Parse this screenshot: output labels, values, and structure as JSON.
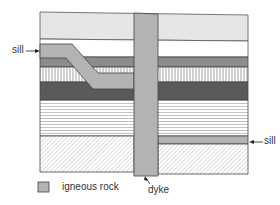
{
  "diagram": {
    "labels": {
      "sill_left": "sill",
      "sill_right": "sill",
      "dyke": "dyke"
    },
    "legend": {
      "items": [
        {
          "swatch_color": "#b3b3b3",
          "label": "igneous rock"
        }
      ]
    },
    "layers": [
      {
        "name": "top-pale-layer",
        "fill": "#e6e6e6"
      },
      {
        "name": "white-layer",
        "fill": "#ffffff"
      },
      {
        "name": "grey-layer",
        "fill": "#8c8c8c"
      },
      {
        "name": "vertical-hatch-layer",
        "fill": "#ffffff",
        "pattern": "vertical-lines"
      },
      {
        "name": "dark-layer",
        "fill": "#5a5a5a"
      },
      {
        "name": "horizontal-lines-layer",
        "fill": "#ffffff",
        "pattern": "horizontal-lines"
      },
      {
        "name": "diagonal-hatch-layer",
        "fill": "#ffffff",
        "pattern": "diagonal-lines"
      }
    ],
    "colors": {
      "igneous": "#b3b3b3",
      "outline": "#444444"
    }
  }
}
